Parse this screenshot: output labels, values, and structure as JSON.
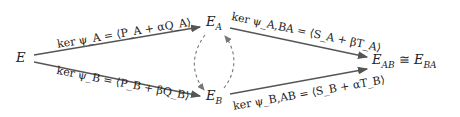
{
  "diagram": {
    "nodes": {
      "E": {
        "text": "E"
      },
      "EA": {
        "base": "E",
        "sub": "A"
      },
      "EB": {
        "base": "E",
        "sub": "B"
      },
      "EAB": {
        "base": "E",
        "sub": "AB",
        "rel": " ≅ ",
        "base2": "E",
        "sub2": "BA"
      }
    },
    "edges": {
      "E_EA": {
        "label": "ker ψ_A = ⟨P_A + αQ_A⟩",
        "style": "solid"
      },
      "E_EB": {
        "label": "ker ψ_B = ⟨P_B + βQ_B⟩",
        "style": "solid"
      },
      "EA_EAB": {
        "label": "ker ψ_A,BA = ⟨S_A + βT_A⟩",
        "style": "solid"
      },
      "EB_EAB": {
        "label": "ker ψ_B,AB = ⟨S_B + αT_B⟩",
        "style": "solid"
      },
      "EA_EB": {
        "label": "",
        "style": "dashed"
      },
      "EB_EA": {
        "label": "",
        "style": "dashed"
      }
    },
    "colors": {
      "solid_arrow": "#555555",
      "dashed_arrow": "#777777",
      "text": "#222222"
    }
  }
}
